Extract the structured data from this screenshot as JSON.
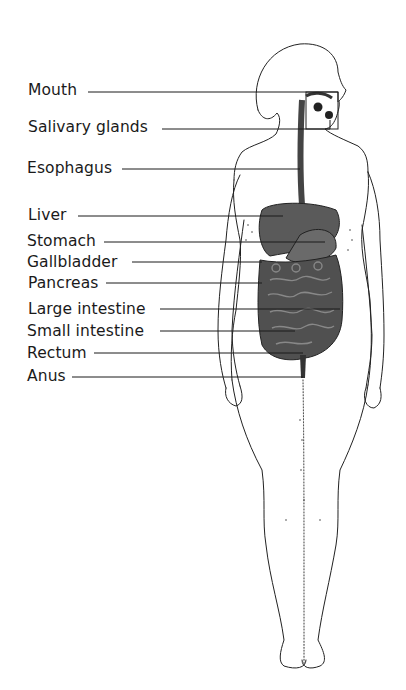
{
  "figure": {
    "labels": [
      {
        "id": "mouth",
        "text": "Mouth",
        "x": 28,
        "y": 80,
        "line_y": 92,
        "target_x": 338
      },
      {
        "id": "salivary-glands",
        "text": "Salivary glands",
        "x": 28,
        "y": 117,
        "line_y": 129,
        "target_x": 330
      },
      {
        "id": "esophagus",
        "text": "Esophagus",
        "x": 27,
        "y": 158,
        "line_y": 169,
        "target_x": 300
      },
      {
        "id": "liver",
        "text": "Liver",
        "x": 28,
        "y": 204,
        "line_y": 216,
        "target_x": 283
      },
      {
        "id": "stomach",
        "text": "Stomach",
        "x": 27,
        "y": 230,
        "line_y": 242,
        "target_x": 325
      },
      {
        "id": "gallbladder",
        "text": "Gallbladder",
        "x": 27,
        "y": 251,
        "line_y": 262,
        "target_x": 262
      },
      {
        "id": "pancreas",
        "text": "Pancreas",
        "x": 28,
        "y": 272,
        "line_y": 283,
        "target_x": 262
      },
      {
        "id": "large-intestine",
        "text": "Large intestine",
        "x": 28,
        "y": 298,
        "line_y": 309,
        "target_x": 340
      },
      {
        "id": "small-intestine",
        "text": "Small intestine",
        "x": 27,
        "y": 320,
        "line_y": 331,
        "target_x": 295
      },
      {
        "id": "rectum",
        "text": "Rectum",
        "x": 27,
        "y": 342,
        "line_y": 353,
        "target_x": 303
      },
      {
        "id": "anus",
        "text": "Anus",
        "x": 27,
        "y": 365,
        "line_y": 377,
        "target_x": 303
      }
    ],
    "colors": {
      "ink": "#1a1a1a",
      "organ_fill": "#555555",
      "background": "#ffffff"
    }
  }
}
